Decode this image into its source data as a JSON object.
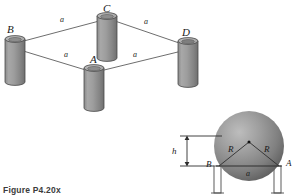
{
  "figure": {
    "caption": "Figure P4.20x",
    "colors": {
      "cylinder_body": "#9a9a9a",
      "cylinder_body_dark": "#7c7c7c",
      "cylinder_top": "#b9b9b9",
      "outline": "#4a4a4a",
      "link_line": "#6e6e6e",
      "sphere_mid": "#8e8e8e",
      "sphere_dark": "#5f5f5f",
      "sphere_light": "#b5b5b5",
      "label_text": "#1a1a1a",
      "caption_text": "#3b3b3b",
      "post_fill": "#ffffff"
    },
    "top_diagram": {
      "name": "four-post-rhombus-isometric",
      "posts": [
        {
          "id": "A",
          "label": "A",
          "label_x": 96,
          "label_y": 62,
          "cx": 94,
          "top_y": 68,
          "height": 40,
          "rx": 10,
          "ry": 3.4
        },
        {
          "id": "B",
          "label": "B",
          "label_x": 10,
          "label_y": 33,
          "cx": 15,
          "top_y": 39,
          "height": 43,
          "rx": 10,
          "ry": 3.4
        },
        {
          "id": "C",
          "label": "C",
          "label_x": 104,
          "label_y": 12,
          "cx": 107,
          "top_y": 16,
          "height": 42,
          "rx": 10,
          "ry": 3.4
        },
        {
          "id": "D",
          "label": "D",
          "label_x": 183,
          "label_y": 36,
          "cx": 188,
          "top_y": 41,
          "height": 43,
          "rx": 10,
          "ry": 3.4
        }
      ],
      "edges": [
        {
          "from": "B",
          "to": "C",
          "label": "a",
          "label_x": 61,
          "label_y": 20
        },
        {
          "from": "C",
          "to": "D",
          "label": "a",
          "label_x": 144,
          "label_y": 22
        },
        {
          "from": "B",
          "to": "A",
          "label": "a",
          "label_x": 65,
          "label_y": 55
        },
        {
          "from": "A",
          "to": "D",
          "label": "a",
          "label_x": 134,
          "label_y": 55
        }
      ]
    },
    "bottom_diagram": {
      "name": "sphere-on-two-posts-front-view",
      "sphere": {
        "cx": 249,
        "cy": 146,
        "r": 35
      },
      "center_dot_label": "",
      "radius_labels": [
        {
          "label": "R",
          "x": 232,
          "y": 146
        },
        {
          "label": "R",
          "x": 266,
          "y": 146
        }
      ],
      "points": [
        {
          "id": "B",
          "label": "B",
          "x": 210,
          "y": 163,
          "contact_x": 219,
          "contact_y": 166
        },
        {
          "id": "A",
          "label": "A",
          "x": 286,
          "y": 163,
          "contact_x": 279,
          "contact_y": 166
        }
      ],
      "chord_label": {
        "label": "a",
        "x": 246,
        "y": 176
      },
      "height_dim": {
        "label": "h",
        "x": 172,
        "y": 152,
        "top_y": 136,
        "bottom_y": 166,
        "arrow_x": 187
      },
      "supports": [
        {
          "id": "post-left",
          "x": 214,
          "y": 166,
          "width": 7,
          "height": 28
        },
        {
          "id": "post-right",
          "x": 274,
          "y": 166,
          "width": 7,
          "height": 28
        }
      ]
    }
  }
}
